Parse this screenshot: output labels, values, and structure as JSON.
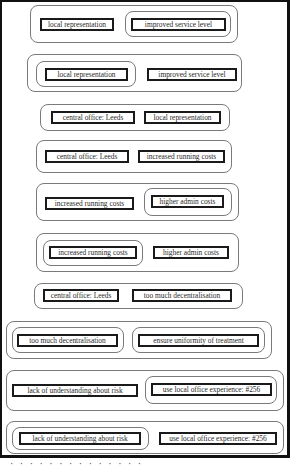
{
  "diagram": {
    "rows": [
      {
        "left": "local representation",
        "right": "improved service level",
        "highlighted": "right"
      },
      {
        "left": "local representation",
        "right": "improved service level",
        "highlighted": "left"
      },
      {
        "left": "central office: Leeds",
        "right": "local representation",
        "highlighted": "none"
      },
      {
        "left": "central office: Leeds",
        "right": "increased running costs",
        "highlighted": "none"
      },
      {
        "left": "increased running costs",
        "right": "higher admin costs",
        "highlighted": "right"
      },
      {
        "left": "increased running costs",
        "right": "higher admin costs",
        "highlighted": "left"
      },
      {
        "left": "central office: Leeds",
        "right": "too much decentralisation",
        "highlighted": "none"
      },
      {
        "left": "too much decentralisation",
        "right": "ensure uniformity of treatment",
        "highlighted": "both"
      },
      {
        "left": "lack of understanding about risk",
        "right": "use local office experience: #256",
        "highlighted": "right"
      },
      {
        "left": "lack of understanding about risk",
        "right": "use local office experience: #256",
        "highlighted": "left"
      }
    ],
    "caption": "· · · ·  · ·  · · ·  ·  · · · ·"
  },
  "colors": {
    "frame": "#111111",
    "group_border": "#7a7a7a",
    "box_border": "#1a1a1a",
    "text": "#2a2a2a"
  }
}
